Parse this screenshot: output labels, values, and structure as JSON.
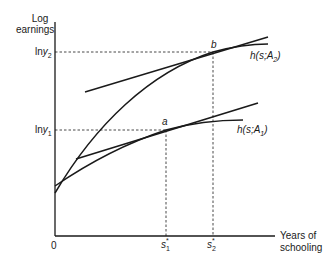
{
  "diagram": {
    "y_axis_label_line1": "Log",
    "y_axis_label_line2": "earnings",
    "x_axis_label_line1": "Years of",
    "x_axis_label_line2": "schooling",
    "origin_label": "0",
    "y_ticks": [
      {
        "id": "lny2",
        "prefix": "ln",
        "var": "y",
        "sub": "2"
      },
      {
        "id": "lny1",
        "prefix": "ln",
        "var": "y",
        "sub": "1"
      }
    ],
    "x_ticks": [
      {
        "id": "s1",
        "var": "s",
        "sup": "*",
        "sub": "1"
      },
      {
        "id": "s2",
        "var": "s",
        "sup": "*",
        "sub": "2"
      }
    ],
    "points": [
      {
        "label": "a"
      },
      {
        "label": "b"
      }
    ],
    "curves": [
      {
        "label_prefix": "h(s;A",
        "label_sub": "2",
        "label_suffix": ")"
      },
      {
        "label_prefix": "h(s;A",
        "label_sub": "1",
        "label_suffix": ")"
      }
    ],
    "colors": {
      "line": "#1a1a1a",
      "background": "#ffffff"
    }
  }
}
